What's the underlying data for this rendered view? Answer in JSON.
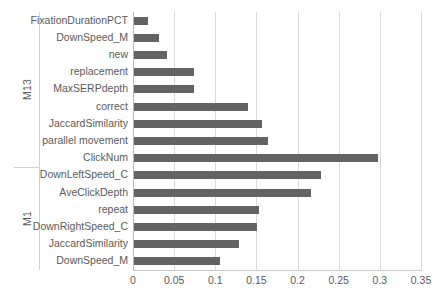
{
  "chart_data": {
    "type": "bar",
    "orientation": "horizontal",
    "title": "",
    "xlabel": "",
    "ylabel": "",
    "xlim": [
      0,
      0.35
    ],
    "xticks": [
      0,
      0.05,
      0.1,
      0.15,
      0.2,
      0.25,
      0.3,
      0.35
    ],
    "xtick_labels": [
      "0",
      "0.05",
      "0.1",
      "0.15",
      "0.2",
      "0.25",
      "0.3",
      "0.35"
    ],
    "grid": true,
    "legend": null,
    "bar_color": "#636363",
    "groups": [
      {
        "label": "M13",
        "categories": [
          "FixationDurationPCT",
          "DownSpeed_M",
          "new",
          "replacement",
          "MaxSERPdepth",
          "correct",
          "JaccardSimilarity",
          "parallel movement",
          "ClickNum"
        ],
        "values": [
          0.017,
          0.03,
          0.04,
          0.073,
          0.073,
          0.139,
          0.156,
          0.163,
          0.297
        ]
      },
      {
        "label": "M1",
        "categories": [
          "DownLeftSpeed_C",
          "AveClickDepth",
          "repeat",
          "DownRightSpeed_C",
          "JaccardSimilarity",
          "DownSpeed_M"
        ],
        "values": [
          0.227,
          0.215,
          0.152,
          0.15,
          0.127,
          0.105
        ]
      }
    ],
    "categories": [
      "FixationDurationPCT",
      "DownSpeed_M",
      "new",
      "replacement",
      "MaxSERPdepth",
      "correct",
      "JaccardSimilarity",
      "parallel movement",
      "ClickNum",
      "DownLeftSpeed_C",
      "AveClickDepth",
      "repeat",
      "DownRightSpeed_C",
      "JaccardSimilarity",
      "DownSpeed_M"
    ],
    "values": [
      0.017,
      0.03,
      0.04,
      0.073,
      0.073,
      0.139,
      0.156,
      0.163,
      0.297,
      0.227,
      0.215,
      0.152,
      0.15,
      0.127,
      0.105
    ]
  }
}
